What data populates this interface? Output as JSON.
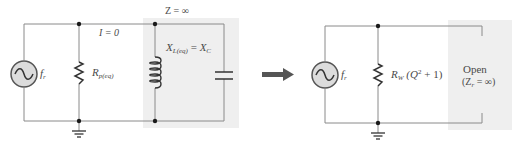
{
  "diagram": {
    "type": "parallel-resonant-circuit-equivalence",
    "colors": {
      "wire": "#8a8a8a",
      "dot": "#1a1a1a",
      "text": "#4a4a4a",
      "shade": "#efefef",
      "source_fill": "#dcdcdc",
      "arrow": "#555555"
    },
    "left_circuit": {
      "top_label": "Z = ∞",
      "current_label": "I = 0",
      "source": {
        "icon": "ac-source-icon",
        "label_main": "f",
        "label_sub": "r"
      },
      "resistor": {
        "icon": "resistor-icon",
        "label_main": "R",
        "label_sub": "p(eq)"
      },
      "inductor": {
        "icon": "inductor-icon"
      },
      "capacitor": {
        "icon": "capacitor-icon"
      },
      "reactance_label": {
        "main1": "X",
        "sub1": "L(eq)",
        "eq": " = ",
        "main2": "X",
        "sub2": "C"
      },
      "ground": {
        "icon": "ground-icon"
      }
    },
    "arrow": {
      "icon": "right-arrow-icon"
    },
    "right_circuit": {
      "source": {
        "icon": "ac-source-icon",
        "label_main": "f",
        "label_sub": "r"
      },
      "resistor": {
        "icon": "resistor-icon",
        "label_main": "R",
        "label_sub": "W",
        "label_expr_open": "(Q",
        "label_sup": "2",
        "label_expr_close": " + 1)"
      },
      "open_label_line1": "Open",
      "open_label_line2_open": "(Z",
      "open_label_line2_sub": "r",
      "open_label_line2_close": " = ∞)",
      "ground": {
        "icon": "ground-icon"
      }
    }
  }
}
